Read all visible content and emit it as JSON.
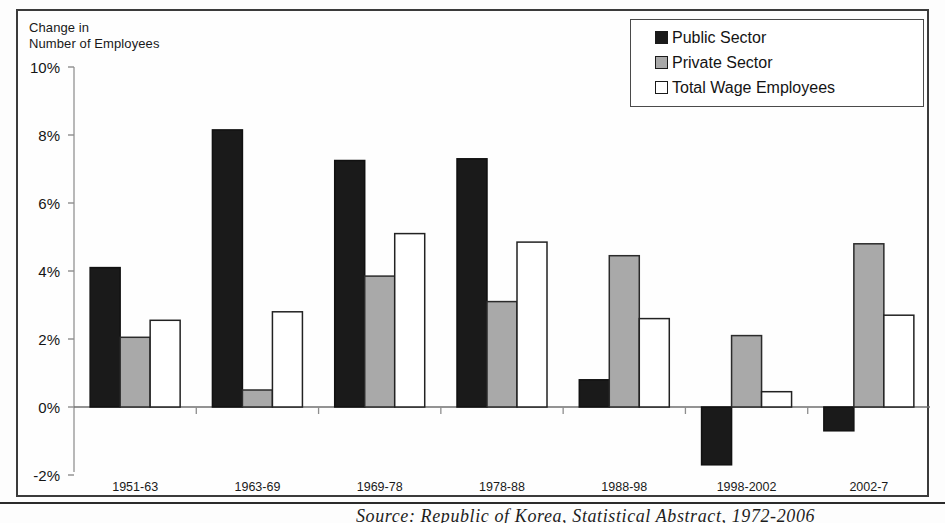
{
  "figure": {
    "axis_title": "Change in\nNumber of Employees",
    "source_note": "Source: Republic of Korea, Statistical Abstract, 1972-2006"
  },
  "legend": {
    "position": "top-right",
    "items": [
      {
        "label": "Public Sector",
        "swatch": "black-square-icon",
        "color": "#1a1a1a"
      },
      {
        "label": "Private Sector",
        "swatch": "gray-square-icon",
        "color": "#a9a9a9"
      },
      {
        "label": "Total Wage Employees",
        "swatch": "white-square-icon",
        "color": "#ffffff"
      }
    ]
  },
  "chart_data": {
    "type": "bar",
    "title": "",
    "subtitle": "",
    "xlabel": "",
    "ylabel": "Change in Number of Employees",
    "ylim": [
      -2,
      10
    ],
    "ytick_values": [
      10,
      8,
      6,
      4,
      2,
      0,
      -2
    ],
    "ytick_labels": [
      "10%",
      "8%",
      "6%",
      "4%",
      "2%",
      "0%",
      "-2%"
    ],
    "grid": false,
    "value_unit": "%",
    "categories": [
      "1951-63",
      "1963-69",
      "1969-78",
      "1978-88",
      "1988-98",
      "1998-2002",
      "2002-7"
    ],
    "series": [
      {
        "name": "Public Sector",
        "color": "#1a1a1a",
        "border": "#111111",
        "values": [
          4.1,
          8.15,
          7.25,
          7.3,
          0.8,
          -1.7,
          -0.7
        ]
      },
      {
        "name": "Private Sector",
        "color": "#a9a9a9",
        "border": "#2b2b2b",
        "values": [
          2.05,
          0.5,
          3.85,
          3.1,
          4.45,
          2.1,
          4.8
        ]
      },
      {
        "name": "Total Wage Employees",
        "color": "#ffffff",
        "border": "#222222",
        "values": [
          2.55,
          2.8,
          5.1,
          4.85,
          2.6,
          0.45,
          2.7
        ]
      }
    ]
  }
}
